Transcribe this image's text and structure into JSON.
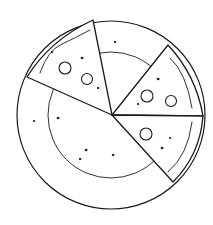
{
  "scene": {
    "description": "Hand-drawn sketch of a plate with three remaining pizza slices",
    "colors": {
      "background": "#ffffff",
      "ink": "#1a1a1a"
    },
    "plate": {
      "cx": 111,
      "cy": 115,
      "outer_r": 94,
      "inner_r": 63
    },
    "slices": [
      {
        "name": "top-left-slice",
        "tip": [
          112,
          115
        ],
        "a": [
          27,
          77
        ],
        "b": [
          93,
          20
        ],
        "pepperoni": [
          [
            64,
            68,
            6
          ],
          [
            86,
            79,
            5.5
          ]
        ]
      },
      {
        "name": "upper-right-slice",
        "tip": [
          112,
          115
        ],
        "a": [
          168,
          45
        ],
        "b": [
          203,
          116
        ],
        "pepperoni": [
          [
            147,
            96,
            6
          ],
          [
            171,
            101,
            5.5
          ]
        ]
      },
      {
        "name": "lower-right-slice",
        "tip": [
          112,
          115
        ],
        "a": [
          203,
          116
        ],
        "b": [
          173,
          182
        ],
        "pepperoni": [
          [
            146,
            134,
            6
          ]
        ]
      }
    ]
  }
}
